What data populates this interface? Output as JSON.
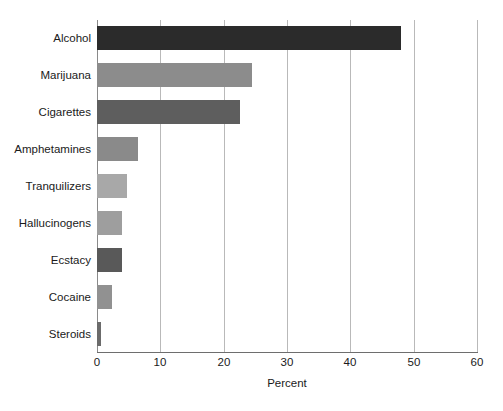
{
  "chart_data": {
    "type": "bar",
    "orientation": "horizontal",
    "title": "",
    "xlabel": "Percent",
    "ylabel": "",
    "xlim": [
      0,
      60
    ],
    "xticks": [
      0,
      10,
      20,
      30,
      40,
      50,
      60
    ],
    "grid": "vertical",
    "legend": "none",
    "categories": [
      "Alcohol",
      "Marijuana",
      "Cigarettes",
      "Amphetamines",
      "Tranquilizers",
      "Hallucinogens",
      "Ecstacy",
      "Cocaine",
      "Steroids"
    ],
    "values": [
      48,
      24.5,
      22.5,
      6.5,
      4.7,
      4.0,
      4.0,
      2.3,
      0.7
    ],
    "bar_colors": [
      "#2b2b2b",
      "#8c8c8c",
      "#5e5e5e",
      "#8a8a8a",
      "#a8a8a8",
      "#9e9e9e",
      "#595959",
      "#919191",
      "#6b6b6b"
    ]
  },
  "axis": {
    "grid_color": "#b9b9b9",
    "baseline_color": "#6e6e6e"
  }
}
